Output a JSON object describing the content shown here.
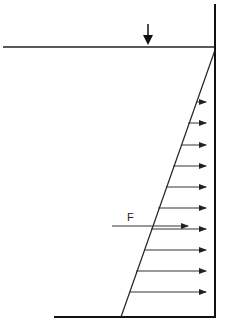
{
  "diagram": {
    "labels": {
      "force": "F"
    },
    "elements": {
      "free_surface": "horizontal water surface line",
      "surface_marker": "down-arrow-icon",
      "wall": "vertical wall",
      "floor": "bottom line",
      "pressure_profile": "triangular distribution, zero at surface, max at bottom",
      "pressure_arrows_count": 10,
      "resultant_force": "F"
    },
    "colors": {
      "line": "#111111",
      "arrow": "#222222"
    }
  }
}
